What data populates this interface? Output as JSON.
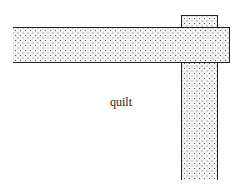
{
  "diagram": {
    "label": "quilt",
    "shapes": [
      {
        "name": "horizontal-strip",
        "fill": "stippled",
        "open_end": "left"
      },
      {
        "name": "vertical-strip",
        "fill": "stippled",
        "open_end": "bottom",
        "layer": "behind-horizontal-strip"
      }
    ],
    "colors": {
      "outline": "#222222",
      "background": "#ffffff"
    }
  }
}
